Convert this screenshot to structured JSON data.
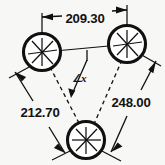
{
  "drawing": {
    "title": "Three-hole bolt circle dimension drawing",
    "background_color": "#f7f7f5",
    "ink_color": "#101010",
    "units_note": "",
    "holes": [
      {
        "id": "hole-left",
        "label": "",
        "cx": 42,
        "cy": 52,
        "r": 18.5
      },
      {
        "id": "hole-right",
        "label": "",
        "cx": 127,
        "cy": 44,
        "r": 18.5
      },
      {
        "id": "hole-bottom",
        "label": "",
        "cx": 86,
        "cy": 140,
        "r": 18.5
      }
    ],
    "dimensions": [
      {
        "id": "dim-top",
        "value": "209.30",
        "orientation": "horizontal",
        "from_hole": "hole-left",
        "to_hole": "hole-right",
        "text_x": 85,
        "text_y": 23,
        "anchor": "middle"
      },
      {
        "id": "dim-left",
        "value": "212.70",
        "orientation": "diagonal",
        "from_hole": "hole-left",
        "to_hole": "hole-bottom",
        "text_x": 40,
        "text_y": 117,
        "anchor": "middle"
      },
      {
        "id": "dim-right",
        "value": "248.00",
        "orientation": "diagonal",
        "from_hole": "hole-right",
        "to_hole": "hole-bottom",
        "text_x": 131,
        "text_y": 107,
        "anchor": "middle"
      }
    ],
    "angle": {
      "id": "angle-x",
      "symbol": "∠",
      "variable": "x",
      "text_x": 74,
      "text_y": 82,
      "vertex_hole": "hole-bottom"
    }
  }
}
